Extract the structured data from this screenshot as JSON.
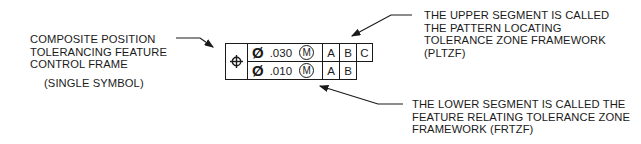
{
  "left_label": {
    "lines": [
      "COMPOSITE POSITION",
      "TOLERANCING FEATURE",
      "CONTROL FRAME"
    ],
    "note": "(SINGLE SYMBOL)"
  },
  "upper_label": {
    "lines": [
      "THE UPPER SEGMENT IS CALLED",
      "THE PATTERN LOCATING",
      "TOLERANCE ZONE FRAMEWORK",
      "(PLTZF)"
    ]
  },
  "lower_label": {
    "lines": [
      "THE LOWER SEGMENT IS CALLED THE",
      "FEATURE RELATING TOLERANCE ZONE",
      "FRAMEWORK (FRTZF)"
    ]
  },
  "feature_control_frame": {
    "symbol": "position-icon",
    "upper": {
      "diameter": "Ø",
      "tolerance": ".030",
      "modifier": "M",
      "datums": [
        "A",
        "B",
        "C"
      ]
    },
    "lower": {
      "diameter": "Ø",
      "tolerance": ".010",
      "modifier": "M",
      "datums": [
        "A",
        "B"
      ]
    }
  },
  "colors": {
    "ink": "#1a1a1a",
    "background": "#ffffff"
  }
}
